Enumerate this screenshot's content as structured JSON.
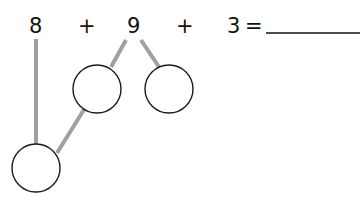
{
  "equation": {
    "term1": "8",
    "op1": "+",
    "term2": "9",
    "op2": "+",
    "term3": "3",
    "equals": "=",
    "answer_blank": ""
  },
  "diagram": {
    "type": "number-bond",
    "line_color": "#a0a0a0",
    "circle_stroke": "#1a1a1a",
    "circles": [
      {
        "id": "split-9-left",
        "value": ""
      },
      {
        "id": "split-9-right",
        "value": ""
      },
      {
        "id": "make-ten",
        "value": ""
      }
    ]
  }
}
